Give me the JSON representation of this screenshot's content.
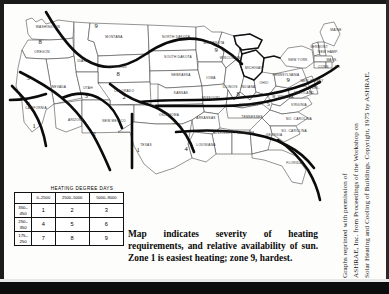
{
  "figure": {
    "type": "map-figure"
  },
  "legend": {
    "title": "HEATING DEGREE DAYS",
    "y_axis_label": "MEAN DAILY SOLAR RADIATION (LY)",
    "column_headers": [
      "0–2500",
      "2500–5000",
      "5000–9000"
    ],
    "row_headers": [
      "350–\n450",
      "250–\n350",
      "175–\n250"
    ],
    "row_headers_flat": [
      "350-450",
      "250-350",
      "175-250"
    ],
    "cells": [
      [
        "1",
        "2",
        "3"
      ],
      [
        "4",
        "5",
        "6"
      ],
      [
        "7",
        "8",
        "9"
      ]
    ]
  },
  "caption": {
    "text": "Map indicates severity of heating requirements, and relative availability of sun. Zone 1 is easiest heating; zone 9, hardest."
  },
  "credit": {
    "line1": "Graphs reprinted with permission of",
    "line2": "ASHRAE, Inc. from Proceedings of the Workshop on",
    "line3": "Solar Heating and Cooling of Buildings. Copyright, 1975 by ASHRAE."
  },
  "map": {
    "state_labels": [
      {
        "name": "WASHINGTON",
        "x": 42,
        "y": 22
      },
      {
        "name": "OREGON",
        "x": 36,
        "y": 47
      },
      {
        "name": "MONTANA",
        "x": 108,
        "y": 32
      },
      {
        "name": "IDAHO",
        "x": 77,
        "y": 56
      },
      {
        "name": "WYOMING",
        "x": 112,
        "y": 62
      },
      {
        "name": "NORTH DAKOTA",
        "x": 170,
        "y": 32
      },
      {
        "name": "SOUTH DAKOTA",
        "x": 172,
        "y": 52
      },
      {
        "name": "NEBRASKA",
        "x": 175,
        "y": 70
      },
      {
        "name": "MINNESOTA",
        "x": 208,
        "y": 38
      },
      {
        "name": "IOWA",
        "x": 205,
        "y": 73
      },
      {
        "name": "WISCONSIN",
        "x": 224,
        "y": 53
      },
      {
        "name": "MICHIGAN",
        "x": 248,
        "y": 63
      },
      {
        "name": "NEVADA",
        "x": 53,
        "y": 82
      },
      {
        "name": "UTAH",
        "x": 82,
        "y": 83
      },
      {
        "name": "COLORADO",
        "x": 118,
        "y": 86
      },
      {
        "name": "KANSAS",
        "x": 175,
        "y": 88
      },
      {
        "name": "MISSOURI",
        "x": 205,
        "y": 93
      },
      {
        "name": "ILLINOIS",
        "x": 224,
        "y": 82
      },
      {
        "name": "INDIANA",
        "x": 242,
        "y": 82
      },
      {
        "name": "OHIO",
        "x": 258,
        "y": 78
      },
      {
        "name": "CALIFORNIA",
        "x": 30,
        "y": 103
      },
      {
        "name": "ARIZONA",
        "x": 70,
        "y": 115
      },
      {
        "name": "NEW MEXICO",
        "x": 108,
        "y": 116
      },
      {
        "name": "OKLAHOMA",
        "x": 163,
        "y": 110
      },
      {
        "name": "ARKANSAS",
        "x": 200,
        "y": 113
      },
      {
        "name": "KENTUCKY",
        "x": 243,
        "y": 100
      },
      {
        "name": "TENNESSEE",
        "x": 246,
        "y": 112
      },
      {
        "name": "W. VIRGINIA",
        "x": 277,
        "y": 92
      },
      {
        "name": "VIRGINIA",
        "x": 293,
        "y": 100
      },
      {
        "name": "NO. CAROLINA",
        "x": 293,
        "y": 114
      },
      {
        "name": "SO. CAROLINA",
        "x": 288,
        "y": 126
      },
      {
        "name": "MISSISSIPPI",
        "x": 218,
        "y": 128
      },
      {
        "name": "ALABAMA",
        "x": 240,
        "y": 128
      },
      {
        "name": "GEORGIA",
        "x": 268,
        "y": 130
      },
      {
        "name": "LOUISIANA",
        "x": 200,
        "y": 140
      },
      {
        "name": "TEXAS",
        "x": 140,
        "y": 140
      },
      {
        "name": "FLORIDA",
        "x": 288,
        "y": 158
      },
      {
        "name": "PENNSYLVANIA",
        "x": 280,
        "y": 70
      },
      {
        "name": "NEW YORK",
        "x": 292,
        "y": 55
      },
      {
        "name": "MAINE",
        "x": 330,
        "y": 25
      },
      {
        "name": "VERMONT",
        "x": 313,
        "y": 42
      },
      {
        "name": "NEW HAMP.",
        "x": 322,
        "y": 47
      },
      {
        "name": "MASS.",
        "x": 326,
        "y": 55
      },
      {
        "name": "CONN.",
        "x": 318,
        "y": 62
      },
      {
        "name": "R.I.",
        "x": 332,
        "y": 62
      },
      {
        "name": "NEW JERSEY",
        "x": 306,
        "y": 76
      },
      {
        "name": "DEL.",
        "x": 310,
        "y": 83
      },
      {
        "name": "MARYLAND",
        "x": 298,
        "y": 88
      }
    ],
    "zone_numbers": [
      {
        "zone": "8",
        "x": 34,
        "y": 38
      },
      {
        "zone": "9",
        "x": 90,
        "y": 22
      },
      {
        "zone": "9",
        "x": 210,
        "y": 46
      },
      {
        "zone": "8",
        "x": 112,
        "y": 70
      },
      {
        "zone": "5",
        "x": 22,
        "y": 74
      },
      {
        "zone": "4",
        "x": 22,
        "y": 100
      },
      {
        "zone": "3",
        "x": 80,
        "y": 92
      },
      {
        "zone": "2",
        "x": 118,
        "y": 93
      },
      {
        "zone": "2",
        "x": 88,
        "y": 130
      },
      {
        "zone": "1",
        "x": 28,
        "y": 122
      },
      {
        "zone": "1",
        "x": 132,
        "y": 146
      },
      {
        "zone": "5",
        "x": 168,
        "y": 118
      },
      {
        "zone": "4",
        "x": 180,
        "y": 145
      },
      {
        "zone": "8",
        "x": 232,
        "y": 90
      },
      {
        "zone": "5",
        "x": 262,
        "y": 100
      },
      {
        "zone": "9",
        "x": 282,
        "y": 76
      }
    ]
  }
}
